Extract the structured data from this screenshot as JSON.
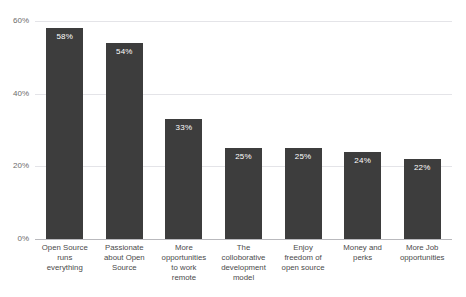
{
  "chart_data": {
    "type": "bar",
    "title": "",
    "subtitle": "",
    "xlabel": "",
    "ylabel": "",
    "ylim": [
      0,
      60
    ],
    "yticks": [
      0,
      20,
      40,
      60
    ],
    "ytick_labels": [
      "0%",
      "20%",
      "40%",
      "60%"
    ],
    "grid": true,
    "legend": null,
    "bar_color": "#3d3d3d",
    "value_label_color": "#ffffff",
    "gridline_color": "#e4e4e8",
    "axis_color": "#b9b9bd",
    "categories": [
      "Open Source runs everything",
      "Passionate about Open Source",
      "More opportunities to work remote",
      "The colloborative development model",
      "Enjoy freedom of open source",
      "Money and perks",
      "More Job opportunities"
    ],
    "category_lines": [
      [
        "Open Source",
        "runs",
        "everything"
      ],
      [
        "Passionate",
        "about Open",
        "Source"
      ],
      [
        "More",
        "opportunities",
        "to work",
        "remote"
      ],
      [
        "The",
        "colloborative",
        "development",
        "model"
      ],
      [
        "Enjoy",
        "freedom of",
        "open source"
      ],
      [
        "Money and",
        "perks"
      ],
      [
        "More Job",
        "opportunities"
      ]
    ],
    "values": [
      58,
      54,
      33,
      25,
      25,
      24,
      22
    ],
    "value_labels": [
      "58%",
      "54%",
      "33%",
      "25%",
      "25%",
      "24%",
      "22%"
    ]
  }
}
